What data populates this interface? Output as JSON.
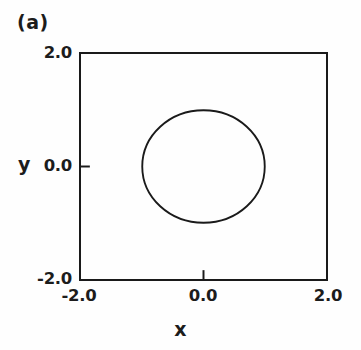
{
  "figure": {
    "panel_label": "(a)",
    "stroke_color": "#1a1a1a",
    "background_color": "#fefefe"
  },
  "chart_data": {
    "type": "line",
    "title": "(a)",
    "xlabel": "x",
    "ylabel": "y",
    "xlim": [
      -2.0,
      2.0
    ],
    "ylim": [
      -2.0,
      2.0
    ],
    "xticks": [
      -2.0,
      0.0,
      2.0
    ],
    "yticks": [
      -2.0,
      0.0,
      2.0
    ],
    "xtick_labels": [
      "-2.0",
      "0.0",
      "2.0"
    ],
    "ytick_labels": [
      "-2.0",
      "0.0",
      "2.0"
    ],
    "grid": false,
    "legend": null,
    "aspect": "equal",
    "series": [
      {
        "name": "closed orbit",
        "shape": "circle",
        "center": [
          0.0,
          0.0
        ],
        "radius": 1.0,
        "closed": true,
        "color": "#1a1a1a",
        "linewidth": 1.6,
        "x": [
          1.0,
          0.966,
          0.866,
          0.707,
          0.5,
          0.259,
          0.0,
          -0.259,
          -0.5,
          -0.707,
          -0.866,
          -0.966,
          -1.0,
          -0.966,
          -0.866,
          -0.707,
          -0.5,
          -0.259,
          0.0,
          0.259,
          0.5,
          0.707,
          0.866,
          0.966,
          1.0
        ],
        "y": [
          0.0,
          0.259,
          0.5,
          0.707,
          0.866,
          0.966,
          1.0,
          0.966,
          0.866,
          0.707,
          0.5,
          0.259,
          0.0,
          -0.259,
          -0.5,
          -0.707,
          -0.866,
          -0.966,
          -1.0,
          -0.966,
          -0.866,
          -0.707,
          -0.5,
          -0.259,
          0.0
        ]
      }
    ]
  },
  "axes": {
    "y_title": "y",
    "x_title": "x",
    "y_tick_top": "2.0",
    "y_tick_mid": "0.0",
    "y_tick_bottom": "-2.0",
    "x_tick_left": "-2.0",
    "x_tick_mid": "0.0",
    "x_tick_right": "2.0"
  }
}
